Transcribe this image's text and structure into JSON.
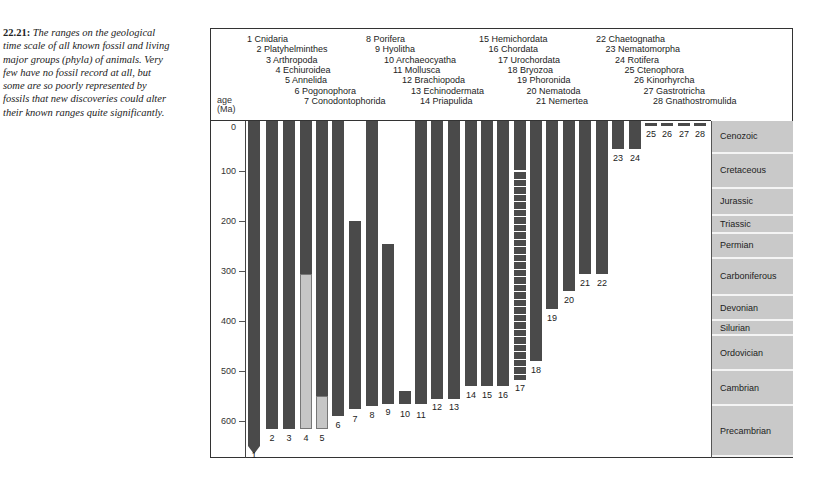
{
  "caption": {
    "figure_number": "22.21:",
    "text": "The ranges on the geological time scale of all known fossil and living major groups (phyla) of animals. Very few have no fossil record at all, but some are so poorly represented by fossils that new discoveries could alter their known ranges quite significantly."
  },
  "axis": {
    "title_line1": "age",
    "title_line2": "(Ma)",
    "ticks": [
      "0",
      "100",
      "200",
      "300",
      "400",
      "500",
      "600"
    ]
  },
  "eras": [
    {
      "name": "Cenozoic",
      "start": 0,
      "end": 65
    },
    {
      "name": "Cretaceous",
      "start": 65,
      "end": 135
    },
    {
      "name": "Jurassic",
      "start": 135,
      "end": 190
    },
    {
      "name": "Triassic",
      "start": 190,
      "end": 225
    },
    {
      "name": "Permian",
      "start": 225,
      "end": 275
    },
    {
      "name": "Carboniferous",
      "start": 275,
      "end": 350
    },
    {
      "name": "Devonian",
      "start": 350,
      "end": 400
    },
    {
      "name": "Silurian",
      "start": 400,
      "end": 430
    },
    {
      "name": "Ordovician",
      "start": 430,
      "end": 500
    },
    {
      "name": "Cambrian",
      "start": 500,
      "end": 570
    },
    {
      "name": "Precambrian",
      "start": 570,
      "end": 672
    }
  ],
  "phyla": [
    {
      "num": "1",
      "label": "1 Cnidaria"
    },
    {
      "num": "2",
      "label": "2 Platyhelminthes"
    },
    {
      "num": "3",
      "label": "3 Arthropoda"
    },
    {
      "num": "4",
      "label": "4 Echiuroidea"
    },
    {
      "num": "5",
      "label": "5 Annelida"
    },
    {
      "num": "6",
      "label": "6 Pogonophora"
    },
    {
      "num": "7",
      "label": "7 Conodontophorida"
    },
    {
      "num": "8",
      "label": "8 Porifera"
    },
    {
      "num": "9",
      "label": "9 Hyolitha"
    },
    {
      "num": "10",
      "label": "10 Archaeocyatha"
    },
    {
      "num": "11",
      "label": "11 Mollusca"
    },
    {
      "num": "12",
      "label": "12 Brachiopoda"
    },
    {
      "num": "13",
      "label": "13 Echinodermata"
    },
    {
      "num": "14",
      "label": "14 Priapulida"
    },
    {
      "num": "15",
      "label": "15 Hemichordata"
    },
    {
      "num": "16",
      "label": "16 Chordata"
    },
    {
      "num": "17",
      "label": "17 Urochordata"
    },
    {
      "num": "18",
      "label": "18 Bryozoa"
    },
    {
      "num": "19",
      "label": "19 Phoronida"
    },
    {
      "num": "20",
      "label": "20 Nematoda"
    },
    {
      "num": "21",
      "label": "21 Nemertea"
    },
    {
      "num": "22",
      "label": "22 Chaetognatha"
    },
    {
      "num": "23",
      "label": "23 Nematomorpha"
    },
    {
      "num": "24",
      "label": "24 Rotifera"
    },
    {
      "num": "25",
      "label": "25 Ctenophora"
    },
    {
      "num": "26",
      "label": "26 Kinorhyrcha"
    },
    {
      "num": "27",
      "label": "27 Gastrotricha"
    },
    {
      "num": "28",
      "label": "28 Gnathostromulida"
    }
  ],
  "colors": {
    "bar": "#4a4a4a",
    "bar_uncertain": "#c6c6c6",
    "era_fill": "#c9c9c9"
  },
  "chart_data": {
    "type": "bar",
    "xlabel": "phylum",
    "ylabel": "age (Ma)",
    "ylim": [
      0,
      670
    ],
    "y_inverted": true,
    "grid": false,
    "categories": [
      "1",
      "2",
      "3",
      "4",
      "5",
      "6",
      "7",
      "8",
      "9",
      "10",
      "11",
      "12",
      "13",
      "14",
      "15",
      "16",
      "17",
      "18",
      "19",
      "20",
      "21",
      "22",
      "23",
      "24",
      "25",
      "26",
      "27",
      "28"
    ],
    "series": [
      {
        "name": "known range top (Ma)",
        "values": [
          0,
          0,
          0,
          0,
          0,
          0,
          200,
          0,
          245,
          540,
          0,
          0,
          0,
          0,
          0,
          0,
          0,
          0,
          0,
          0,
          0,
          0,
          0,
          0,
          0,
          0,
          0,
          0
        ]
      },
      {
        "name": "known range base (Ma)",
        "values": [
          670,
          615,
          615,
          615,
          615,
          590,
          575,
          570,
          565,
          565,
          565,
          555,
          555,
          530,
          530,
          530,
          515,
          480,
          375,
          340,
          305,
          305,
          55,
          55,
          5,
          5,
          5,
          5
        ]
      },
      {
        "name": "poorly known (light) segment",
        "values": [
          null,
          null,
          null,
          "305-615",
          "550-615",
          null,
          null,
          null,
          null,
          null,
          null,
          null,
          null,
          null,
          null,
          null,
          null,
          null,
          null,
          null,
          null,
          null,
          null,
          null,
          null,
          null,
          null,
          null
        ]
      },
      {
        "name": "dashed (sparse record) segment",
        "values": [
          null,
          null,
          null,
          null,
          null,
          null,
          null,
          null,
          null,
          null,
          null,
          null,
          null,
          null,
          null,
          null,
          "100-515",
          null,
          null,
          null,
          null,
          null,
          null,
          null,
          null,
          null,
          null,
          null
        ]
      }
    ],
    "annotations": [
      "Phylum 1 (Cnidaria) range extends beyond 650 Ma (arrow)"
    ],
    "era_bands": [
      "Cenozoic",
      "Cretaceous",
      "Jurassic",
      "Triassic",
      "Permian",
      "Carboniferous",
      "Devonian",
      "Silurian",
      "Ordovician",
      "Cambrian",
      "Precambrian"
    ]
  }
}
